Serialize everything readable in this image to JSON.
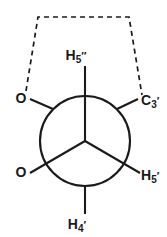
{
  "figure": {
    "type": "newman-projection",
    "background_color": "#ffffff",
    "stroke_color": "#1a1a1a",
    "geometry": {
      "width": 167,
      "height": 237,
      "circle_center_x": 85,
      "circle_center_y": 141,
      "circle_radius": 45
    },
    "front_atom": {
      "name": "front-carbon",
      "substituent_positions": [
        "top",
        "lower-left",
        "lower-right"
      ]
    },
    "back_atom": {
      "name": "back-carbon",
      "substituent_positions": [
        "upper-left",
        "upper-right",
        "bottom"
      ]
    },
    "labels": [
      {
        "id": "h5pp",
        "base": "H",
        "sub": "5",
        "prime": "″",
        "full": "H5″",
        "position": "top",
        "bond": "front"
      },
      {
        "id": "c3p",
        "base": "C",
        "sub": "3",
        "prime": "′",
        "full": "C3′",
        "position": "upper-right",
        "bond": "back"
      },
      {
        "id": "h5p",
        "base": "H",
        "sub": "5",
        "prime": "′",
        "full": "H5′",
        "position": "lower-right",
        "bond": "front"
      },
      {
        "id": "h4p",
        "base": "H",
        "sub": "4",
        "prime": "′",
        "full": "H4′",
        "position": "bottom",
        "bond": "back"
      },
      {
        "id": "o-upper",
        "base": "O",
        "sub": "",
        "prime": "",
        "full": "O",
        "position": "upper-left",
        "bond": "back"
      },
      {
        "id": "o-lower",
        "base": "O",
        "sub": "",
        "prime": "",
        "full": "O",
        "position": "lower-left",
        "bond": "front"
      }
    ],
    "tether": {
      "name": "dashed-ring-closure",
      "style": "dashed",
      "from_label": "o-upper",
      "to_label": "c3p",
      "description": "dashed trapezoidal bracket connecting O to C3′"
    }
  }
}
